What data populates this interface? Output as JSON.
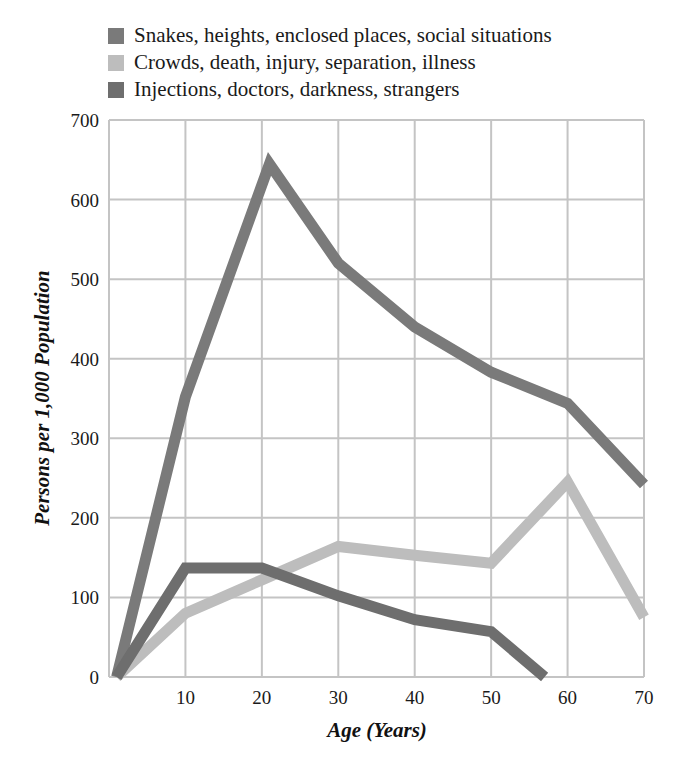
{
  "chart_data": {
    "type": "line",
    "title": "",
    "xlabel": "Age (Years)",
    "ylabel": "Persons per 1,000 Population",
    "xlim": [
      0,
      70
    ],
    "ylim": [
      0,
      700
    ],
    "xticks": [
      10,
      20,
      30,
      40,
      50,
      60,
      70
    ],
    "yticks": [
      0,
      100,
      200,
      300,
      400,
      500,
      600,
      700
    ],
    "grid": true,
    "legend_position": "top",
    "series": [
      {
        "name": "Snakes, heights, enclosed places, social situations",
        "color": "#7a7a7a",
        "points": [
          [
            1,
            0
          ],
          [
            10,
            352
          ],
          [
            21,
            645
          ],
          [
            30,
            520
          ],
          [
            40,
            440
          ],
          [
            50,
            383
          ],
          [
            60,
            344
          ],
          [
            70,
            242
          ]
        ]
      },
      {
        "name": "Crowds, death, injury, separation, illness",
        "color": "#bdbdbd",
        "points": [
          [
            1,
            0
          ],
          [
            10,
            80
          ],
          [
            20,
            122
          ],
          [
            30,
            164
          ],
          [
            40,
            153
          ],
          [
            50,
            143
          ],
          [
            60,
            245
          ],
          [
            70,
            75
          ]
        ]
      },
      {
        "name": "Injections, doctors, darkness, strangers",
        "color": "#6e6e6e",
        "points": [
          [
            1,
            0
          ],
          [
            10,
            137
          ],
          [
            20,
            137
          ],
          [
            30,
            102
          ],
          [
            40,
            72
          ],
          [
            50,
            57
          ],
          [
            57,
            0
          ]
        ]
      }
    ]
  }
}
